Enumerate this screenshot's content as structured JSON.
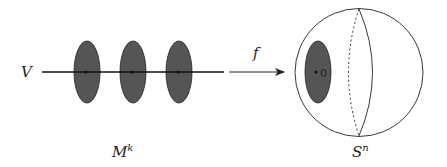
{
  "diagram": {
    "colors": {
      "disk_fill": "#555555",
      "stroke": "#222222",
      "background": "#ffffff"
    },
    "left": {
      "line_label": "V",
      "manifold_label": "M",
      "manifold_superscript": "k",
      "disks": [
        {
          "cx": 87,
          "cy": 72
        },
        {
          "cx": 133,
          "cy": 72
        },
        {
          "cx": 179,
          "cy": 72
        }
      ]
    },
    "map": {
      "label": "f"
    },
    "right": {
      "sphere_label": "S",
      "sphere_superscript": "n",
      "disk_point_label": "0"
    }
  }
}
